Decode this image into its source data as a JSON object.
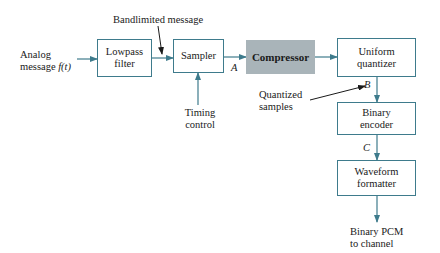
{
  "diagram": {
    "input": {
      "line1": "Analog",
      "line2_text": "message ",
      "line2_symbol": "f(t)"
    },
    "blocks": {
      "lowpass": {
        "line1": "Lowpass",
        "line2": "filter"
      },
      "sampler": {
        "line1": "Sampler"
      },
      "compressor": {
        "line1": "Compressor"
      },
      "quantizer": {
        "line1": "Uniform",
        "line2": "quantizer"
      },
      "encoder": {
        "line1": "Binary",
        "line2": "encoder"
      },
      "formatter": {
        "line1": "Waveform",
        "line2": "formatter"
      }
    },
    "annotations": {
      "bandlimited": "Bandlimited message",
      "timing_line1": "Timing",
      "timing_line2": "control",
      "quantized_line1": "Quantized",
      "quantized_line2": "samples",
      "point_a": "A",
      "point_b": "B",
      "point_c": "C"
    },
    "output": {
      "line1": "Binary PCM",
      "line2": "to channel"
    },
    "colors": {
      "line": "#3e7b8c",
      "compressor_fill": "#a9b4b9",
      "pointer": "#1a1a1a"
    }
  }
}
